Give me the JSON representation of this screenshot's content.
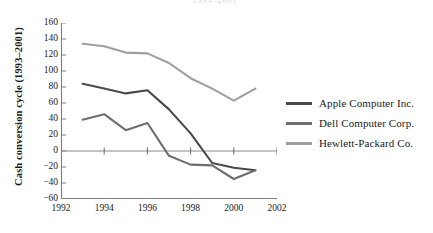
{
  "figure": {
    "top_truncated_text": "1993–2001"
  },
  "chart_data": {
    "type": "line",
    "title": "",
    "xlabel": "",
    "ylabel": "Cash conversion cycle (1993–2001)",
    "xlim": [
      1992,
      2002
    ],
    "ylim": [
      -60,
      160
    ],
    "xticks": [
      1992,
      1994,
      1996,
      1998,
      2000,
      2002
    ],
    "xtick_labels": [
      "1992",
      "1994",
      "1996",
      "1998",
      "2000",
      "2002"
    ],
    "yticks": [
      160,
      140,
      120,
      100,
      80,
      60,
      40,
      20,
      0,
      -20,
      -40,
      -60
    ],
    "ytick_labels": [
      "160",
      "140",
      "120",
      "100",
      "80",
      "60",
      "40",
      "20",
      "0",
      "−20",
      "−40",
      "−60"
    ],
    "grid": false,
    "zero_line": true,
    "legend_position": "right",
    "x": [
      1993,
      1994,
      1995,
      1996,
      1997,
      1998,
      1999,
      2000,
      2001
    ],
    "series": [
      {
        "name": "Apple Computer Inc.",
        "color": "#4a4a4a",
        "values": [
          84,
          78,
          72,
          76,
          52,
          22,
          -15,
          -21,
          -24
        ]
      },
      {
        "name": "Dell Computer Corp.",
        "color": "#6e6e6e",
        "values": [
          39,
          46,
          26,
          35,
          -6,
          -17,
          -18,
          -35,
          -24
        ]
      },
      {
        "name": "Hewlett-Packard Co.",
        "color": "#9e9e9e",
        "values": [
          134,
          131,
          123,
          122,
          110,
          91,
          78,
          63,
          78
        ]
      }
    ]
  },
  "legend": {
    "items": [
      {
        "label": "Apple Computer Inc.",
        "color": "#4a4a4a"
      },
      {
        "label": "Dell Computer Corp.",
        "color": "#6e6e6e"
      },
      {
        "label": "Hewlett-Packard Co.",
        "color": "#9e9e9e"
      }
    ]
  }
}
